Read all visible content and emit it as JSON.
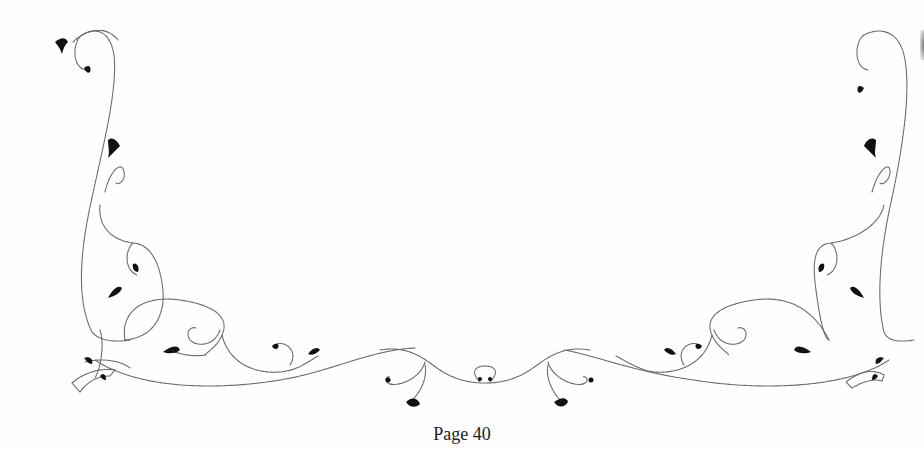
{
  "document": {
    "footer": {
      "page_label": "Page 40"
    },
    "ornament": {
      "style": "floral-swirl-border",
      "stroke_color": "#6a6a6a",
      "leaf_color": "#111111",
      "background": "#fefefe"
    }
  }
}
